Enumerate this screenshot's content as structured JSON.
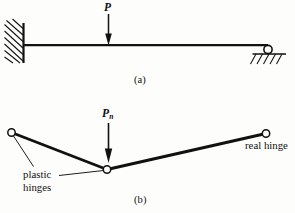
{
  "figure": {
    "type": "engineering-diagram",
    "ink_color": "#111111",
    "background_color": "#fdfdfb",
    "panels": [
      {
        "id": "a",
        "caption": "(a)",
        "description": "Propped cantilever: fixed support at left, roller support at right, point load P at midspan",
        "load_label": "P",
        "supports": [
          "fixed-wall",
          "roller"
        ]
      },
      {
        "id": "b",
        "caption": "(b)",
        "description": "Collapse mechanism with two plastic hinges and one real hinge",
        "load_label": "P",
        "load_subscript": "n",
        "annotations": [
          {
            "text_line_1": "plastic",
            "text_line_2": "hinges"
          },
          {
            "text_line_1": "real hinge"
          }
        ]
      }
    ],
    "labels": {
      "load_a": "P",
      "load_b_base": "P",
      "load_b_sub": "n",
      "caption_a": "(a)",
      "caption_b": "(b)",
      "plastic_hinges_line1": "plastic",
      "plastic_hinges_line2": "hinges",
      "real_hinge": "real hinge"
    }
  }
}
